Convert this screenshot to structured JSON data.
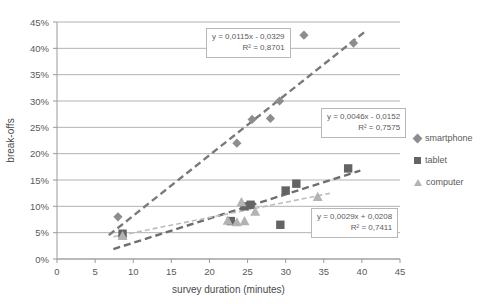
{
  "chart_data": {
    "type": "scatter",
    "title": "",
    "xlabel": "survey duration (minutes)",
    "ylabel": "break-offs",
    "xlim": [
      0,
      45
    ],
    "ylim": [
      0,
      0.45
    ],
    "xticks": [
      0,
      5,
      10,
      15,
      20,
      25,
      30,
      35,
      40,
      45
    ],
    "xticklabels": [
      "0",
      "5",
      "10",
      "15",
      "20",
      "25",
      "30",
      "35",
      "40",
      "45"
    ],
    "yticks": [
      0,
      0.05,
      0.1,
      0.15,
      0.2,
      0.25,
      0.3,
      0.35,
      0.4,
      0.45
    ],
    "yticklabels": [
      "0%",
      "5%",
      "10%",
      "15%",
      "20%",
      "25%",
      "30%",
      "35%",
      "40%",
      "45%"
    ],
    "grid": "horizontal",
    "legend_position": "right",
    "series": [
      {
        "name": "smartphone",
        "marker": "diamond",
        "color": "#8d8d8d",
        "points": [
          {
            "x": 8.0,
            "y": 0.08
          },
          {
            "x": 8.6,
            "y": 0.045
          },
          {
            "x": 23.6,
            "y": 0.22
          },
          {
            "x": 25.6,
            "y": 0.265
          },
          {
            "x": 28.0,
            "y": 0.267
          },
          {
            "x": 29.2,
            "y": 0.3
          },
          {
            "x": 32.4,
            "y": 0.425
          },
          {
            "x": 38.9,
            "y": 0.41
          }
        ],
        "trendline": {
          "equation": "y = 0,0115x - 0,0329",
          "r2": "R² = 0,8701",
          "slope": 0.0115,
          "intercept": -0.0329,
          "style": "dashed",
          "color": "#7a7a7a"
        }
      },
      {
        "name": "tablet",
        "marker": "square",
        "color": "#646464",
        "points": [
          {
            "x": 8.6,
            "y": 0.048
          },
          {
            "x": 22.8,
            "y": 0.072
          },
          {
            "x": 24.6,
            "y": 0.1
          },
          {
            "x": 25.4,
            "y": 0.103
          },
          {
            "x": 29.3,
            "y": 0.065
          },
          {
            "x": 30.0,
            "y": 0.13
          },
          {
            "x": 31.4,
            "y": 0.143
          },
          {
            "x": 38.2,
            "y": 0.172
          }
        ],
        "trendline": {
          "equation": "y = 0,0046x - 0,0152",
          "r2": "R² = 0,7575",
          "slope": 0.0046,
          "intercept": -0.0152,
          "style": "dashed",
          "color": "#6e6e6e"
        }
      },
      {
        "name": "computer",
        "marker": "triangle",
        "color": "#b3b3b3",
        "points": [
          {
            "x": 8.6,
            "y": 0.044
          },
          {
            "x": 22.4,
            "y": 0.073
          },
          {
            "x": 23.6,
            "y": 0.07
          },
          {
            "x": 24.2,
            "y": 0.108
          },
          {
            "x": 24.6,
            "y": 0.072
          },
          {
            "x": 26.0,
            "y": 0.09
          },
          {
            "x": 34.2,
            "y": 0.118
          }
        ],
        "trendline": {
          "equation": "y = 0,0029x + 0,0208",
          "r2": "R² = 0,7411",
          "slope": 0.0029,
          "intercept": 0.0208,
          "style": "dashed",
          "color": "#bdbdbd"
        }
      }
    ],
    "annotations": [
      {
        "id": "eq-smartphone",
        "line1": "y = 0,0115x - 0,0329",
        "line2": "R² = 0,8701"
      },
      {
        "id": "eq-tablet",
        "line1": "y = 0,0046x - 0,0152",
        "line2": "R² = 0,7575"
      },
      {
        "id": "eq-computer",
        "line1": "y = 0,0029x + 0,0208",
        "line2": "R² = 0,7411"
      }
    ]
  },
  "legend": {
    "items": [
      {
        "label": "smartphone",
        "marker": "diamond"
      },
      {
        "label": "tablet",
        "marker": "square"
      },
      {
        "label": "computer",
        "marker": "triangle"
      }
    ]
  }
}
